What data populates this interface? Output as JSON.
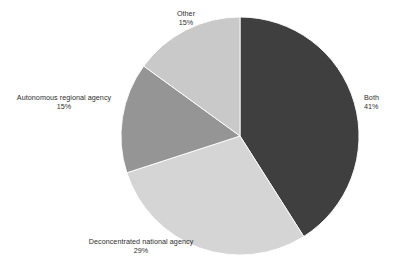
{
  "chart_data": {
    "type": "pie",
    "title": "",
    "subtitle": "",
    "xlabel": "",
    "ylabel": "",
    "legend_position": "none",
    "grid": false,
    "labels_outside": true,
    "start_angle_deg": 0,
    "direction": "clockwise",
    "center": {
      "x": 240,
      "y": 136
    },
    "radius": 119,
    "categories": [
      "Both",
      "Deconcentrated national agency",
      "Autonomous regional agency",
      "Other"
    ],
    "values": [
      41,
      29,
      15,
      15
    ],
    "value_unit": "%",
    "colors": [
      "#3f3f3f",
      "#d5d5d5",
      "#959595",
      "#c9c9c9"
    ],
    "slices": [
      {
        "name": "Both",
        "value": 41,
        "value_text": "41%",
        "color": "#3f3f3f",
        "start_deg": 0,
        "end_deg": 147.6,
        "label_position": "right"
      },
      {
        "name": "Deconcentrated national agency",
        "value": 29,
        "value_text": "29%",
        "color": "#d5d5d5",
        "start_deg": 147.6,
        "end_deg": 252.0,
        "label_position": "bottom"
      },
      {
        "name": "Autonomous regional agency",
        "value": 15,
        "value_text": "15%",
        "color": "#959595",
        "start_deg": 252.0,
        "end_deg": 306.0,
        "label_position": "left"
      },
      {
        "name": "Other",
        "value": 15,
        "value_text": "15%",
        "color": "#c9c9c9",
        "start_deg": 306.0,
        "end_deg": 360.0,
        "label_position": "top"
      }
    ],
    "background_color": "#ffffff",
    "label_text_color": "#2e2e2e"
  },
  "labels": {
    "other": {
      "name": "Other",
      "pct": "15%"
    },
    "autonomous": {
      "name": "Autonomous regional agency",
      "pct": "15%"
    },
    "both": {
      "name": "Both",
      "pct": "41%"
    },
    "deconcentrated": {
      "name": "Deconcentrated national agency",
      "pct": "29%"
    }
  }
}
